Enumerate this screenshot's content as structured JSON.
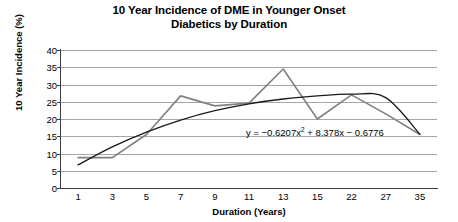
{
  "chart_data": {
    "type": "line",
    "title": "10 Year Incidence of DME in Younger Onset Diabetics by Duration",
    "title_line1": "10 Year Incidence of DME in Younger Onset",
    "title_line2": "Diabetics by Duration",
    "xlabel": "Duration (Years)",
    "ylabel": "10 Year Incidence (%)",
    "categories": [
      "1",
      "3",
      "5",
      "7",
      "9",
      "11",
      "13",
      "15",
      "22",
      "27",
      "35"
    ],
    "ylim": [
      0,
      40
    ],
    "yticks": [
      "0",
      "5",
      "10",
      "15",
      "20",
      "25",
      "30",
      "35",
      "40"
    ],
    "grid": true,
    "legend": "none",
    "series": [
      {
        "name": "10 Year Incidence",
        "color": "#808080",
        "values": [
          8.8,
          8.8,
          15.5,
          26.7,
          23.8,
          24.6,
          34.5,
          20.0,
          27.0,
          21.5,
          15.5
        ]
      },
      {
        "name": "Polynomial trendline",
        "color": "#1a1a1a",
        "type": "trendline",
        "values": [
          6.7,
          11.9,
          16.2,
          19.7,
          22.4,
          24.4,
          25.8,
          26.7,
          27.2,
          26.2,
          15.6
        ]
      }
    ],
    "annotations": [
      {
        "name": "trendline-equation",
        "text": "y = −0.6207x² + 8.378x − 0.6776",
        "text_prefix": "y = −0.6207x",
        "text_exponent": "2",
        "text_suffix": " + 8.378x − 0.6776"
      }
    ]
  }
}
